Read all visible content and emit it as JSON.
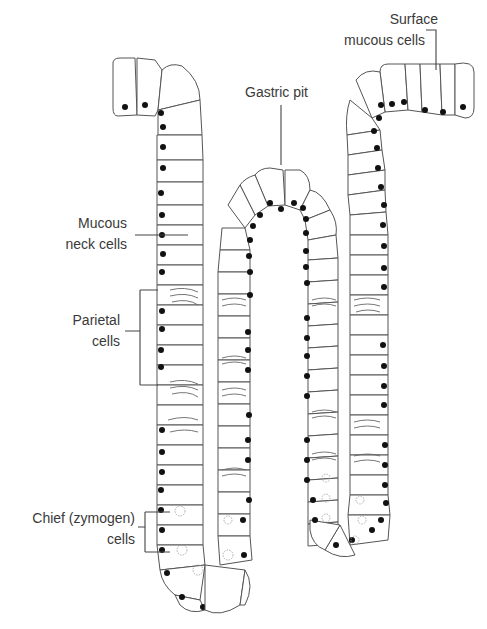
{
  "figure": {
    "labels": {
      "surface_mucous": [
        "Surface",
        "mucous cells"
      ],
      "gastric_pit": "Gastric pit",
      "mucous_neck": [
        "Mucous",
        "neck cells"
      ],
      "parietal": [
        "Parietal",
        "cells"
      ],
      "chief": [
        "Chief (zymogen)",
        "cells"
      ]
    },
    "colors": {
      "background": "#ffffff",
      "outline": "#555555",
      "nucleus": "#111111",
      "text": "#3a3a3a"
    }
  }
}
